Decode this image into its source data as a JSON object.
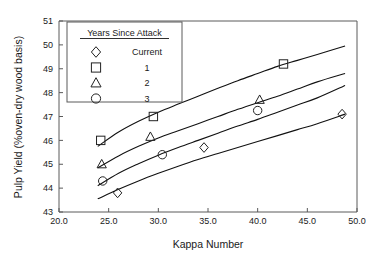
{
  "chart_data": {
    "type": "scatter",
    "title": "",
    "xlabel": "Kappa Number",
    "ylabel": "Pulp Yield  (%oven-dry wood basis)",
    "xlim": [
      20.0,
      50.0
    ],
    "ylim": [
      43,
      51
    ],
    "xticks": [
      "20.0",
      "25.0",
      "30.0",
      "35.0",
      "40.0",
      "45.0",
      "50.0"
    ],
    "yticks": [
      "43",
      "44",
      "45",
      "46",
      "47",
      "48",
      "49",
      "50",
      "51"
    ],
    "grid": false,
    "legend": {
      "position": "top-left-inside",
      "title": "Years Since Attack",
      "entries": [
        {
          "marker": "diamond",
          "label": "Current"
        },
        {
          "marker": "square",
          "label": "1"
        },
        {
          "marker": "triangle",
          "label": "2"
        },
        {
          "marker": "circle",
          "label": "3"
        }
      ]
    },
    "series": [
      {
        "name": "Current",
        "marker": "diamond",
        "points": [
          {
            "x": 25.9,
            "y": 43.8
          },
          {
            "x": 34.6,
            "y": 45.7
          },
          {
            "x": 48.5,
            "y": 47.1
          }
        ],
        "fit_curve": [
          {
            "x": 23.9,
            "y": 43.55
          },
          {
            "x": 26.0,
            "y": 43.95
          },
          {
            "x": 28.0,
            "y": 44.3
          },
          {
            "x": 30.0,
            "y": 44.62
          },
          {
            "x": 32.0,
            "y": 44.92
          },
          {
            "x": 34.0,
            "y": 45.2
          },
          {
            "x": 36.0,
            "y": 45.45
          },
          {
            "x": 38.0,
            "y": 45.7
          },
          {
            "x": 40.0,
            "y": 45.95
          },
          {
            "x": 42.0,
            "y": 46.2
          },
          {
            "x": 44.0,
            "y": 46.45
          },
          {
            "x": 46.0,
            "y": 46.7
          },
          {
            "x": 48.8,
            "y": 47.1
          }
        ]
      },
      {
        "name": "3",
        "marker": "circle",
        "points": [
          {
            "x": 24.4,
            "y": 44.3
          },
          {
            "x": 30.4,
            "y": 45.4
          },
          {
            "x": 40.0,
            "y": 47.25
          }
        ],
        "fit_curve": [
          {
            "x": 23.9,
            "y": 44.1
          },
          {
            "x": 26.0,
            "y": 44.62
          },
          {
            "x": 28.0,
            "y": 45.02
          },
          {
            "x": 30.0,
            "y": 45.38
          },
          {
            "x": 32.0,
            "y": 45.7
          },
          {
            "x": 34.0,
            "y": 46.0
          },
          {
            "x": 36.0,
            "y": 46.3
          },
          {
            "x": 38.0,
            "y": 46.6
          },
          {
            "x": 40.0,
            "y": 46.88
          },
          {
            "x": 42.0,
            "y": 47.18
          },
          {
            "x": 44.0,
            "y": 47.48
          },
          {
            "x": 46.0,
            "y": 47.78
          },
          {
            "x": 48.8,
            "y": 48.3
          }
        ]
      },
      {
        "name": "2",
        "marker": "triangle",
        "points": [
          {
            "x": 24.3,
            "y": 45.0
          },
          {
            "x": 29.2,
            "y": 46.15
          },
          {
            "x": 40.2,
            "y": 47.7
          }
        ],
        "fit_curve": [
          {
            "x": 23.9,
            "y": 44.85
          },
          {
            "x": 26.0,
            "y": 45.35
          },
          {
            "x": 28.0,
            "y": 45.75
          },
          {
            "x": 30.0,
            "y": 46.1
          },
          {
            "x": 32.0,
            "y": 46.4
          },
          {
            "x": 34.0,
            "y": 46.7
          },
          {
            "x": 36.0,
            "y": 47.0
          },
          {
            "x": 38.0,
            "y": 47.3
          },
          {
            "x": 40.0,
            "y": 47.58
          },
          {
            "x": 42.0,
            "y": 47.85
          },
          {
            "x": 44.0,
            "y": 48.15
          },
          {
            "x": 46.0,
            "y": 48.45
          },
          {
            "x": 48.8,
            "y": 48.8
          }
        ]
      },
      {
        "name": "1",
        "marker": "square",
        "points": [
          {
            "x": 24.2,
            "y": 46.0
          },
          {
            "x": 29.5,
            "y": 47.0
          },
          {
            "x": 42.6,
            "y": 49.2
          }
        ],
        "fit_curve": [
          {
            "x": 23.9,
            "y": 45.75
          },
          {
            "x": 26.0,
            "y": 46.35
          },
          {
            "x": 28.0,
            "y": 46.8
          },
          {
            "x": 30.0,
            "y": 47.18
          },
          {
            "x": 32.0,
            "y": 47.52
          },
          {
            "x": 34.0,
            "y": 47.85
          },
          {
            "x": 36.0,
            "y": 48.18
          },
          {
            "x": 38.0,
            "y": 48.5
          },
          {
            "x": 40.0,
            "y": 48.8
          },
          {
            "x": 42.0,
            "y": 49.1
          },
          {
            "x": 44.0,
            "y": 49.35
          },
          {
            "x": 46.0,
            "y": 49.6
          },
          {
            "x": 48.8,
            "y": 49.95
          }
        ]
      }
    ]
  }
}
